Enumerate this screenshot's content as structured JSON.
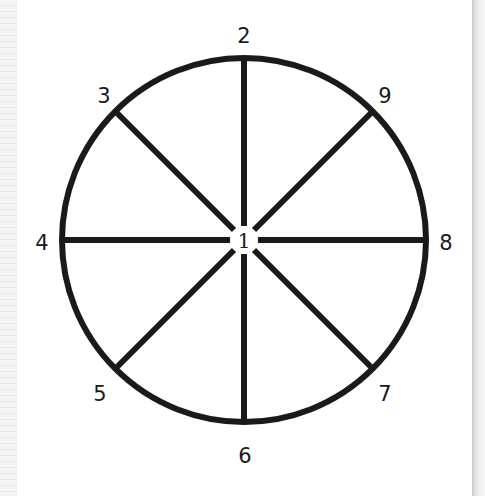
{
  "diagram": {
    "type": "circle-with-spokes",
    "center_label": "1",
    "spoke_labels": [
      {
        "id": "top",
        "label": "2"
      },
      {
        "id": "top-left",
        "label": "3"
      },
      {
        "id": "left",
        "label": "4"
      },
      {
        "id": "bottom-left",
        "label": "5"
      },
      {
        "id": "bottom",
        "label": "6"
      },
      {
        "id": "bottom-right",
        "label": "7"
      },
      {
        "id": "right",
        "label": "8"
      },
      {
        "id": "top-right",
        "label": "9"
      }
    ],
    "stroke_color": "#1a1a1a"
  }
}
